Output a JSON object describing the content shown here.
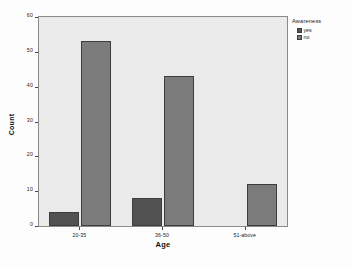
{
  "chart_data": {
    "type": "bar",
    "title": "",
    "subtitle": "",
    "xlabel": "Age",
    "ylabel": "Count",
    "categories": [
      "20-35",
      "36-50",
      "51-above"
    ],
    "series": [
      {
        "name": "yes",
        "values": [
          4,
          8,
          0
        ],
        "color": "#525252"
      },
      {
        "name": "no",
        "values": [
          53,
          43,
          12
        ],
        "color": "#7b7b7b"
      }
    ],
    "ylim": [
      0,
      60
    ],
    "yticks": [
      0,
      10,
      20,
      30,
      40,
      50,
      60
    ],
    "ytick_labels": [
      "0",
      "10",
      "20",
      "30",
      "40",
      "50",
      "60"
    ],
    "grid": false,
    "legend": {
      "title": "Awareness",
      "position": "right",
      "entries": [
        "yes",
        "no"
      ]
    },
    "plot_background": "#eaeaea",
    "figure_background": "#fdfdfd",
    "axis_color": "#8a8a8a"
  },
  "caption": ""
}
